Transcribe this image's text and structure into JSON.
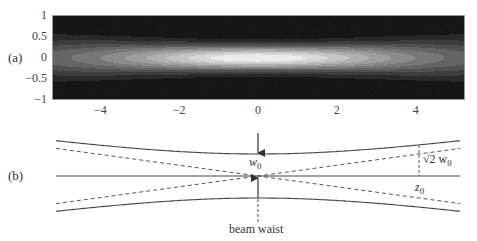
{
  "panel_a": {
    "label": "(a)",
    "x_ticks": [
      {
        "value": -4,
        "label": "−4"
      },
      {
        "value": -2,
        "label": "−2"
      },
      {
        "value": 0,
        "label": "0"
      },
      {
        "value": 2,
        "label": "2"
      },
      {
        "value": 4,
        "label": "4"
      }
    ],
    "y_ticks": [
      {
        "value": 1,
        "label": "1"
      },
      {
        "value": 0.5,
        "label": "0.5"
      },
      {
        "value": 0,
        "label": "0"
      },
      {
        "value": -0.5,
        "label": "−0.5"
      },
      {
        "value": -1,
        "label": "−1"
      }
    ],
    "xlim": [
      -5.2,
      5.25
    ],
    "ylim": [
      -1,
      1
    ],
    "colormap": "grayscale",
    "contour_levels": 12
  },
  "panel_b": {
    "label": "(b)",
    "waist_label": "w",
    "waist_sub": "0",
    "rayleigh_label": "z",
    "rayleigh_sub": "0",
    "rayleigh_width_prefix": "√2 w",
    "rayleigh_width_sub": "0",
    "beam_waist_label": "beam waist",
    "line_color": "#444444",
    "dash_color": "#555555"
  },
  "chart_data": {
    "type": "heatmap",
    "title": "",
    "xlabel": "",
    "ylabel": "",
    "x_range": [
      -5.2,
      5.25
    ],
    "y_range": [
      -1,
      1
    ],
    "x_ticks": [
      -4,
      -2,
      0,
      2,
      4
    ],
    "y_ticks": [
      -1,
      -0.5,
      0,
      0.5,
      1
    ],
    "function": "Gaussian beam intensity I(z,r) = (w0/w(z))^2 * exp(-2 r^2 / w(z)^2), w(z) = w0*sqrt(1+(z/z0)^2)",
    "parameters": {
      "w0": 0.4,
      "z0": 4.0
    },
    "colormap": "grayscale (black = 0, white = max)",
    "peak": {
      "x": 0,
      "y": 0
    },
    "grid": false,
    "legend": "none"
  }
}
